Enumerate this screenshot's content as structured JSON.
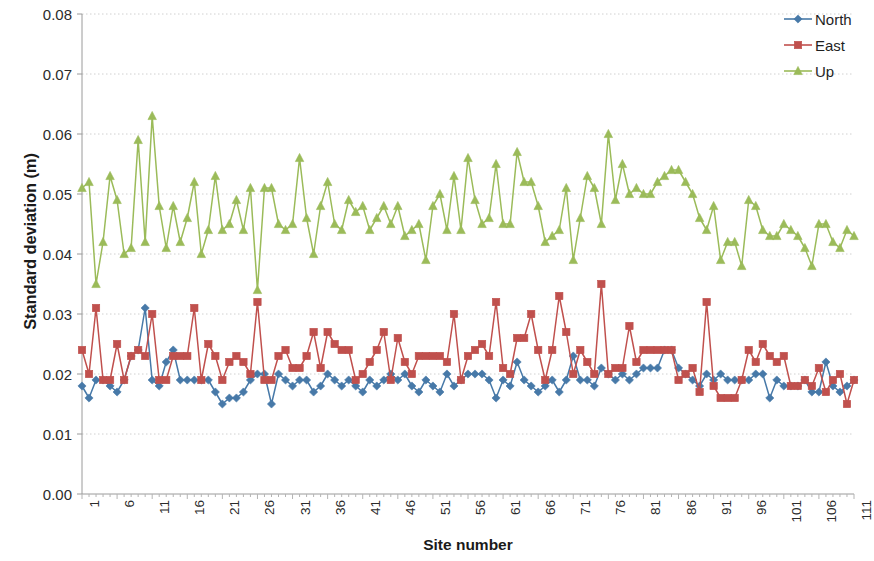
{
  "chart_data": {
    "type": "line",
    "title": "",
    "xlabel": "Site number",
    "ylabel": "Standard deviation (m)",
    "xlim": [
      1,
      111
    ],
    "ylim": [
      0.0,
      0.08
    ],
    "ytick_values": [
      0.08,
      0.07,
      0.06,
      0.05,
      0.04,
      0.03,
      0.02,
      0.01,
      0.0
    ],
    "ytick_labels": [
      "0.08",
      "0.07",
      "0.06",
      "0.05",
      "0.04",
      "0.03",
      "0.02",
      "0.01",
      "0.00"
    ],
    "xtick_values": [
      1,
      6,
      11,
      16,
      21,
      26,
      31,
      36,
      41,
      46,
      51,
      56,
      61,
      66,
      71,
      76,
      81,
      86,
      91,
      96,
      101,
      106,
      111
    ],
    "xtick_labels": [
      "1",
      "6",
      "11",
      "16",
      "21",
      "26",
      "31",
      "36",
      "41",
      "46",
      "51",
      "56",
      "61",
      "66",
      "71",
      "76",
      "81",
      "86",
      "91",
      "96",
      "101",
      "106",
      "111"
    ],
    "grid": true,
    "grid_axis": "y",
    "legend_position": "top-right",
    "x": [
      1,
      2,
      3,
      4,
      5,
      6,
      7,
      8,
      9,
      10,
      11,
      12,
      13,
      14,
      15,
      16,
      17,
      18,
      19,
      20,
      21,
      22,
      23,
      24,
      25,
      26,
      27,
      28,
      29,
      30,
      31,
      32,
      33,
      34,
      35,
      36,
      37,
      38,
      39,
      40,
      41,
      42,
      43,
      44,
      45,
      46,
      47,
      48,
      49,
      50,
      51,
      52,
      53,
      54,
      55,
      56,
      57,
      58,
      59,
      60,
      61,
      62,
      63,
      64,
      65,
      66,
      67,
      68,
      69,
      70,
      71,
      72,
      73,
      74,
      75,
      76,
      77,
      78,
      79,
      80,
      81,
      82,
      83,
      84,
      85,
      86,
      87,
      88,
      89,
      90,
      91,
      92,
      93,
      94,
      95,
      96,
      97,
      98,
      99,
      100,
      101,
      102,
      103,
      104,
      105,
      106,
      107,
      108,
      109,
      110,
      111
    ],
    "series": [
      {
        "name": "North",
        "color": "#4779A8",
        "marker": "diamond",
        "values": [
          0.018,
          0.016,
          0.019,
          0.019,
          0.018,
          0.017,
          0.019,
          0.023,
          0.024,
          0.031,
          0.019,
          0.018,
          0.022,
          0.024,
          0.019,
          0.019,
          0.019,
          0.019,
          0.019,
          0.017,
          0.015,
          0.016,
          0.016,
          0.017,
          0.019,
          0.02,
          0.02,
          0.015,
          0.02,
          0.019,
          0.018,
          0.019,
          0.019,
          0.017,
          0.018,
          0.02,
          0.019,
          0.018,
          0.019,
          0.018,
          0.017,
          0.019,
          0.018,
          0.019,
          0.02,
          0.019,
          0.02,
          0.018,
          0.017,
          0.019,
          0.018,
          0.017,
          0.02,
          0.018,
          0.019,
          0.02,
          0.02,
          0.02,
          0.019,
          0.016,
          0.019,
          0.018,
          0.022,
          0.019,
          0.018,
          0.017,
          0.018,
          0.019,
          0.017,
          0.019,
          0.023,
          0.019,
          0.019,
          0.018,
          0.021,
          0.02,
          0.019,
          0.02,
          0.019,
          0.02,
          0.021,
          0.021,
          0.021,
          0.024,
          0.024,
          0.021,
          0.02,
          0.019,
          0.018,
          0.02,
          0.019,
          0.02,
          0.019,
          0.019,
          0.019,
          0.019,
          0.02,
          0.02,
          0.016,
          0.019,
          0.018,
          0.018,
          0.018,
          0.019,
          0.017,
          0.017,
          0.022,
          0.018,
          0.017,
          0.018,
          0.019
        ]
      },
      {
        "name": "East",
        "color": "#C0504D",
        "marker": "square",
        "values": [
          0.024,
          0.02,
          0.031,
          0.019,
          0.019,
          0.025,
          0.019,
          0.023,
          0.024,
          0.023,
          0.03,
          0.019,
          0.019,
          0.023,
          0.023,
          0.023,
          0.031,
          0.019,
          0.025,
          0.023,
          0.019,
          0.022,
          0.023,
          0.022,
          0.02,
          0.032,
          0.019,
          0.019,
          0.023,
          0.024,
          0.021,
          0.021,
          0.023,
          0.027,
          0.021,
          0.027,
          0.025,
          0.024,
          0.024,
          0.019,
          0.02,
          0.022,
          0.024,
          0.027,
          0.019,
          0.026,
          0.022,
          0.02,
          0.023,
          0.023,
          0.023,
          0.023,
          0.022,
          0.03,
          0.019,
          0.023,
          0.024,
          0.025,
          0.023,
          0.032,
          0.021,
          0.02,
          0.026,
          0.026,
          0.03,
          0.024,
          0.019,
          0.024,
          0.033,
          0.027,
          0.02,
          0.024,
          0.022,
          0.02,
          0.035,
          0.02,
          0.021,
          0.021,
          0.028,
          0.022,
          0.024,
          0.024,
          0.024,
          0.024,
          0.024,
          0.019,
          0.02,
          0.021,
          0.017,
          0.032,
          0.018,
          0.016,
          0.016,
          0.016,
          0.019,
          0.024,
          0.022,
          0.025,
          0.023,
          0.022,
          0.023,
          0.018,
          0.018,
          0.019,
          0.018,
          0.021,
          0.017,
          0.019,
          0.02,
          0.015,
          0.019
        ]
      },
      {
        "name": "Up",
        "color": "#9BBB59",
        "marker": "triangle",
        "values": [
          0.051,
          0.052,
          0.035,
          0.042,
          0.053,
          0.049,
          0.04,
          0.041,
          0.059,
          0.042,
          0.063,
          0.048,
          0.041,
          0.048,
          0.042,
          0.046,
          0.052,
          0.04,
          0.044,
          0.053,
          0.044,
          0.045,
          0.049,
          0.044,
          0.051,
          0.034,
          0.051,
          0.051,
          0.045,
          0.044,
          0.045,
          0.056,
          0.046,
          0.04,
          0.048,
          0.052,
          0.045,
          0.044,
          0.049,
          0.047,
          0.048,
          0.044,
          0.046,
          0.048,
          0.045,
          0.048,
          0.043,
          0.044,
          0.045,
          0.039,
          0.048,
          0.05,
          0.044,
          0.053,
          0.044,
          0.056,
          0.049,
          0.045,
          0.046,
          0.055,
          0.045,
          0.045,
          0.057,
          0.052,
          0.052,
          0.048,
          0.042,
          0.043,
          0.044,
          0.051,
          0.039,
          0.046,
          0.053,
          0.051,
          0.045,
          0.06,
          0.049,
          0.055,
          0.05,
          0.051,
          0.05,
          0.05,
          0.052,
          0.053,
          0.054,
          0.054,
          0.052,
          0.05,
          0.046,
          0.044,
          0.048,
          0.039,
          0.042,
          0.042,
          0.038,
          0.049,
          0.048,
          0.044,
          0.043,
          0.043,
          0.045,
          0.044,
          0.043,
          0.041,
          0.038,
          0.045,
          0.045,
          0.042,
          0.041,
          0.044,
          0.043
        ]
      }
    ]
  },
  "legend": {
    "items": [
      {
        "label": "North"
      },
      {
        "label": "East"
      },
      {
        "label": "Up"
      }
    ]
  },
  "axes": {
    "x_title": "Site number",
    "y_title": "Standard deviation (m)"
  }
}
